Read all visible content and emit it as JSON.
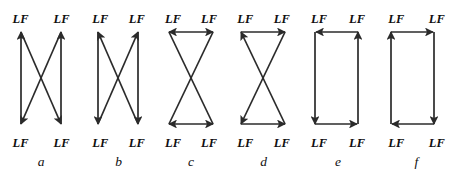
{
  "figure": {
    "node_label": "LF",
    "background_color": "#ffffff",
    "stroke_color": "#2b2b2b",
    "text_color": "#0f0f0f",
    "panel_count": 6,
    "panels": [
      {
        "id": "a",
        "caption": "a",
        "top_labels": [
          "LF",
          "LF"
        ],
        "bottom_labels": [
          "LF",
          "LF"
        ],
        "edges": [
          {
            "name": "left-vertical-up",
            "from": "bottom-left",
            "to": "top-left",
            "arrow": "end"
          },
          {
            "name": "right-vertical-up",
            "from": "bottom-right",
            "to": "top-right",
            "arrow": "end"
          },
          {
            "name": "diagonal-top-left-to-bottom-right",
            "from": "top-left",
            "to": "bottom-right",
            "arrow": "end"
          },
          {
            "name": "diagonal-top-right-to-bottom-left",
            "from": "top-right",
            "to": "bottom-left",
            "arrow": "end"
          }
        ]
      },
      {
        "id": "b",
        "caption": "b",
        "top_labels": [
          "LF",
          "LF"
        ],
        "bottom_labels": [
          "LF",
          "LF"
        ],
        "edges": [
          {
            "name": "left-vertical-down",
            "from": "top-left",
            "to": "bottom-left",
            "arrow": "end"
          },
          {
            "name": "right-vertical-down",
            "from": "top-right",
            "to": "bottom-right",
            "arrow": "end"
          },
          {
            "name": "diagonal-bottom-left-to-top-right",
            "from": "bottom-left",
            "to": "top-right",
            "arrow": "end"
          },
          {
            "name": "diagonal-bottom-right-to-top-left",
            "from": "bottom-right",
            "to": "top-left",
            "arrow": "end"
          }
        ]
      },
      {
        "id": "c",
        "caption": "c",
        "top_labels": [
          "LF",
          "LF"
        ],
        "bottom_labels": [
          "LF",
          "LF"
        ],
        "edges": [
          {
            "name": "top-horizontal-double",
            "from": "top-left",
            "to": "top-right",
            "arrow": "both"
          },
          {
            "name": "bottom-horizontal-double",
            "from": "bottom-left",
            "to": "bottom-right",
            "arrow": "both"
          },
          {
            "name": "diagonal-top-left-to-bottom-right",
            "from": "top-left",
            "to": "bottom-right",
            "arrow": "none"
          },
          {
            "name": "diagonal-top-right-to-bottom-left",
            "from": "top-right",
            "to": "bottom-left",
            "arrow": "none"
          }
        ]
      },
      {
        "id": "d",
        "caption": "d",
        "top_labels": [
          "LF",
          "LF"
        ],
        "bottom_labels": [
          "LF",
          "LF"
        ],
        "edges": [
          {
            "name": "top-horizontal-right",
            "from": "top-left",
            "to": "top-right",
            "arrow": "end"
          },
          {
            "name": "bottom-horizontal-right",
            "from": "bottom-left",
            "to": "bottom-right",
            "arrow": "end"
          },
          {
            "name": "diagonal-bottom-right-to-top-left",
            "from": "bottom-right",
            "to": "top-left",
            "arrow": "end"
          },
          {
            "name": "diagonal-top-right-to-bottom-left",
            "from": "top-right",
            "to": "bottom-left",
            "arrow": "end"
          }
        ]
      },
      {
        "id": "e",
        "caption": "e",
        "top_labels": [
          "LF",
          "LF"
        ],
        "bottom_labels": [
          "LF",
          "LF"
        ],
        "edges": [
          {
            "name": "top-horizontal-left",
            "from": "top-right",
            "to": "top-left",
            "arrow": "end"
          },
          {
            "name": "left-vertical-down",
            "from": "top-left",
            "to": "bottom-left",
            "arrow": "end"
          },
          {
            "name": "bottom-horizontal-right",
            "from": "bottom-left",
            "to": "bottom-right",
            "arrow": "end"
          },
          {
            "name": "right-vertical-up",
            "from": "bottom-right",
            "to": "top-right",
            "arrow": "end"
          }
        ]
      },
      {
        "id": "f",
        "caption": "f",
        "top_labels": [
          "LF",
          "LF"
        ],
        "bottom_labels": [
          "LF",
          "LF"
        ],
        "edges": [
          {
            "name": "top-horizontal-right",
            "from": "top-left",
            "to": "top-right",
            "arrow": "end"
          },
          {
            "name": "right-vertical-down",
            "from": "top-right",
            "to": "bottom-right",
            "arrow": "end"
          },
          {
            "name": "bottom-horizontal-left",
            "from": "bottom-right",
            "to": "bottom-left",
            "arrow": "end"
          },
          {
            "name": "left-vertical-up",
            "from": "bottom-left",
            "to": "top-left",
            "arrow": "end"
          }
        ]
      }
    ]
  }
}
